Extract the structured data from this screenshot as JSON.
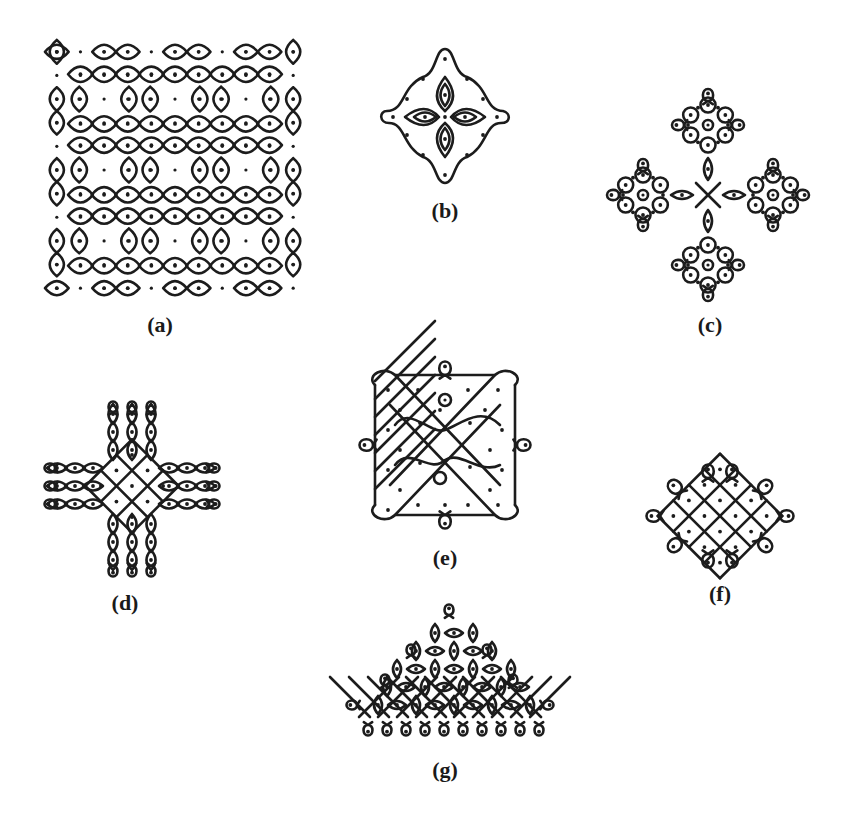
{
  "figure": {
    "ink_color": "#1c1c1c",
    "background": "#ffffff",
    "panels": [
      {
        "id": "a",
        "label": "(a)",
        "shape": "square grid of looped squares",
        "x": 45,
        "y": 40,
        "w": 260,
        "h": 260,
        "label_x": 160,
        "label_y": 312
      },
      {
        "id": "b",
        "label": "(b)",
        "shape": "four-petal diamond",
        "x": 383,
        "y": 45,
        "w": 123,
        "h": 140,
        "label_x": 445,
        "label_y": 198
      },
      {
        "id": "c",
        "label": "(c)",
        "shape": "four hexagonal rosettes in a diamond",
        "x": 603,
        "y": 85,
        "w": 210,
        "h": 220,
        "label_x": 710,
        "label_y": 312
      },
      {
        "id": "d",
        "label": "(d)",
        "shape": "cross / plus",
        "x": 47,
        "y": 400,
        "w": 170,
        "h": 178,
        "label_x": 125,
        "label_y": 590
      },
      {
        "id": "e",
        "label": "(e)",
        "shape": "square with side loops and central waves",
        "x": 350,
        "y": 350,
        "w": 190,
        "h": 187,
        "label_x": 445,
        "label_y": 545
      },
      {
        "id": "f",
        "label": "(f)",
        "shape": "small diamond lattice",
        "x": 640,
        "y": 450,
        "w": 158,
        "h": 132,
        "label_x": 720,
        "label_y": 581
      },
      {
        "id": "g",
        "label": "(g)",
        "shape": "triangular / mountain lattice",
        "x": 345,
        "y": 605,
        "w": 210,
        "h": 142,
        "label_x": 445,
        "label_y": 757
      }
    ]
  }
}
